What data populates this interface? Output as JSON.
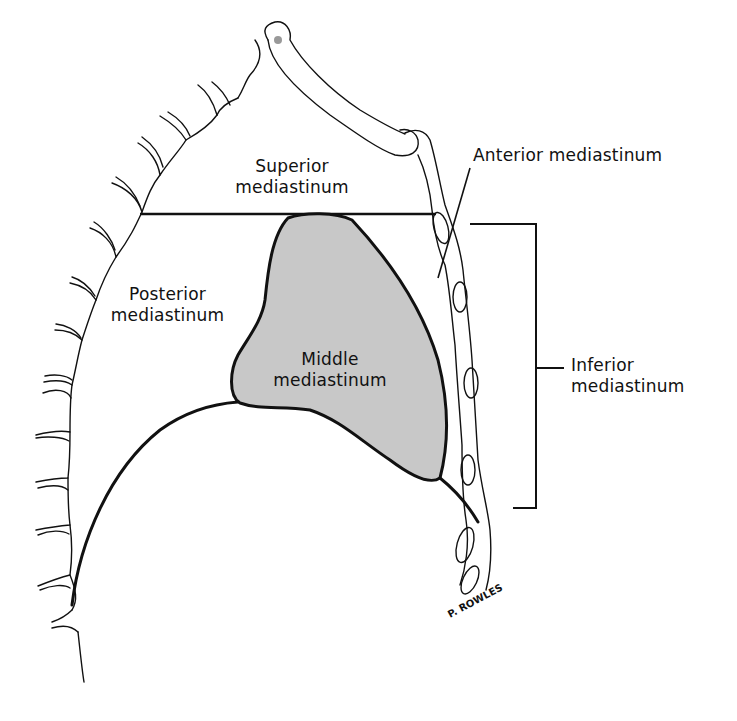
{
  "diagram": {
    "colors": {
      "background": "#ffffff",
      "line": "#111111",
      "middle_fill": "#c8c8c8"
    },
    "labels": {
      "superior": {
        "line1": "Superior",
        "line2": "mediastinum"
      },
      "anterior": {
        "text": "Anterior mediastinum"
      },
      "posterior": {
        "line1": "Posterior",
        "line2": "mediastinum"
      },
      "middle": {
        "line1": "Middle",
        "line2": "mediastinum"
      },
      "inferior": {
        "line1": "Inferior",
        "line2": "mediastinum"
      }
    },
    "signature": "P. ROWLES"
  }
}
